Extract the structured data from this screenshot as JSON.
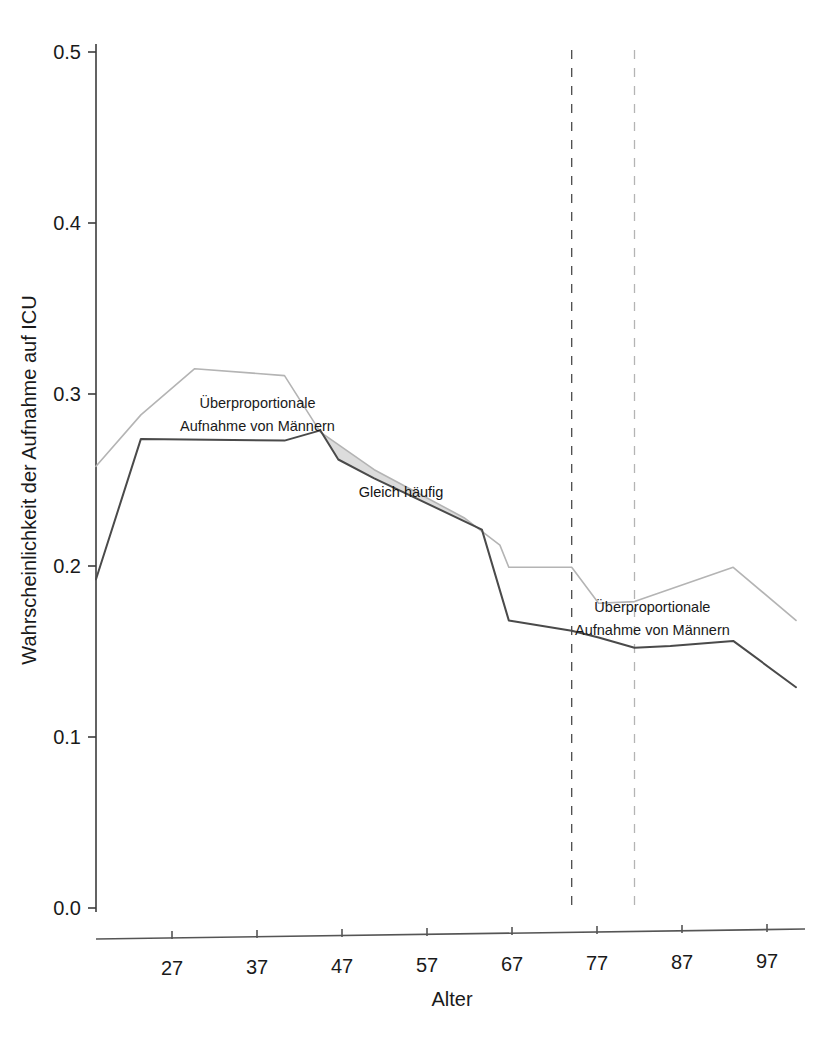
{
  "chart_data": {
    "type": "line",
    "title": "",
    "xlabel": "Alter",
    "ylabel": "Wahrscheinlichkeit der Aufnahme auf ICU",
    "xlim": [
      21,
      100
    ],
    "ylim": [
      0.0,
      0.5
    ],
    "xticks": [
      27,
      37,
      47,
      57,
      67,
      77,
      87,
      97
    ],
    "xtick_labels": [
      "27",
      "37",
      "47",
      "57",
      "67",
      "77",
      "87",
      "97"
    ],
    "yticks": [
      0.0,
      0.1,
      0.2,
      0.3,
      0.4,
      0.5
    ],
    "ytick_labels": [
      "0.0",
      "0.1",
      "0.2",
      "0.3",
      "0.4",
      "0.5"
    ],
    "grid": false,
    "legend_position": "none",
    "series": [
      {
        "name": "Frauen",
        "color": "#b4b4b4",
        "x": [
          21,
          26,
          32,
          42,
          46,
          52,
          62,
          66,
          67,
          74,
          77,
          81,
          92,
          99
        ],
        "values": [
          0.258,
          0.288,
          0.315,
          0.311,
          0.278,
          0.256,
          0.228,
          0.212,
          0.199,
          0.199,
          0.178,
          0.179,
          0.199,
          0.168
        ]
      },
      {
        "name": "Männer",
        "color": "#4a4a4a",
        "x": [
          21,
          26,
          42,
          46,
          48,
          52,
          62,
          64,
          67,
          74,
          77,
          81,
          85,
          92,
          99
        ],
        "values": [
          0.192,
          0.274,
          0.273,
          0.279,
          0.262,
          0.251,
          0.226,
          0.221,
          0.168,
          0.162,
          0.158,
          0.152,
          0.153,
          0.156,
          0.129
        ]
      }
    ],
    "shaded_band": {
      "label": "Gleich häufig",
      "fill_color": "#dcdcdc",
      "x_start": 46,
      "x_end": 64
    },
    "vlines": [
      {
        "x": 74,
        "style": "dashed",
        "color": "#4a4a4a"
      },
      {
        "x": 81,
        "style": "dashed",
        "color": "#b4b4b4"
      }
    ],
    "annotations": [
      {
        "text_line1": "Überproportionale",
        "text_line2": "Aufnahme von Männern",
        "x": 39,
        "y": 0.295
      },
      {
        "text_line1": "Gleich häufig",
        "text_line2": "",
        "x": 55,
        "y": 0.243
      },
      {
        "text_line1": "Überproportionale",
        "text_line2": "Aufnahme von Männern",
        "x": 83,
        "y": 0.176
      }
    ]
  },
  "axis": {
    "x_title": "Alter",
    "y_title": "Wahrscheinlichkeit der Aufnahme auf ICU",
    "ytick_0": "0.0",
    "ytick_1": "0.1",
    "ytick_2": "0.2",
    "ytick_3": "0.3",
    "ytick_4": "0.4",
    "ytick_5": "0.5",
    "xtick_0": "27",
    "xtick_1": "37",
    "xtick_2": "47",
    "xtick_3": "57",
    "xtick_4": "67",
    "xtick_5": "77",
    "xtick_6": "87",
    "xtick_7": "97"
  },
  "labels": {
    "annot_top_l1": "Überproportionale",
    "annot_top_l2": "Aufnahme von Männern",
    "annot_band": "Gleich häufig",
    "annot_bottom_l1": "Überproportionale",
    "annot_bottom_l2": "Aufnahme von Männern"
  }
}
